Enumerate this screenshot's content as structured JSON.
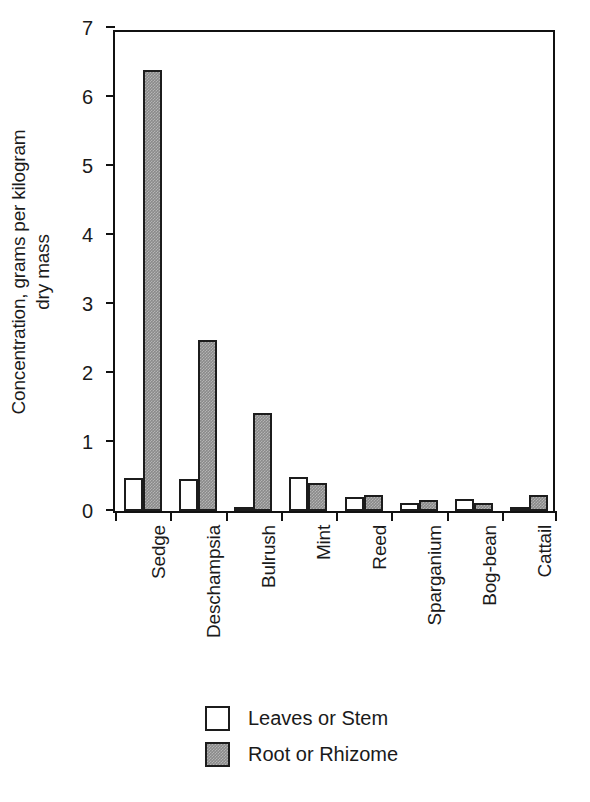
{
  "chart_data": {
    "type": "bar",
    "title": "",
    "xlabel": "",
    "ylabel": "Concentration, grams per kilogram dry mass",
    "ylabel_line1": "Concentration, grams per kilogram",
    "ylabel_line2": "dry mass",
    "ylim": [
      0,
      7
    ],
    "yticks": [
      0,
      1,
      2,
      3,
      4,
      5,
      6,
      7
    ],
    "ytick_labels": [
      "0",
      "1",
      "2",
      "3",
      "4",
      "5",
      "6",
      "7"
    ],
    "grid": false,
    "legend_position": "bottom-center",
    "categories": [
      "Sedge",
      "Deschampsia",
      "Bulrush",
      "Mint",
      "Reed",
      "Sparganium",
      "Bog-bean",
      "Cattail"
    ],
    "series": [
      {
        "name": "Leaves or Stem",
        "fill": "#ffffff",
        "values": [
          0.48,
          0.47,
          0.06,
          0.49,
          0.2,
          0.11,
          0.17,
          0.05
        ]
      },
      {
        "name": "Root or Rhizome",
        "fill": "#8a8a8a",
        "values": [
          6.39,
          2.48,
          1.42,
          0.4,
          0.23,
          0.16,
          0.11,
          0.23
        ]
      }
    ]
  },
  "legend": {
    "items": [
      {
        "label": "Leaves or Stem",
        "style": "leaves"
      },
      {
        "label": "Root or Rhizome",
        "style": "root"
      }
    ]
  },
  "colors": {
    "axis": "#111111",
    "bar_outline": "#1c1c1c",
    "leaves_fill": "#ffffff",
    "root_fill": "#8a8a8a",
    "background": "#ffffff"
  }
}
